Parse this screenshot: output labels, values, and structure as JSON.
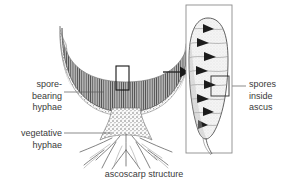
{
  "figure": {
    "caption": "ascoscarp structure",
    "background_color": "#ffffff",
    "text_color": "#3a3a3a"
  },
  "labels": {
    "spore_bearing": "spore-\nbearing\nhyphae",
    "spore_bearing_lines": [
      "spore-",
      "bearing",
      "hyphae"
    ],
    "vegetative": "vegetative\nhyphae",
    "vegetative_lines": [
      "vegetative",
      "hyphae"
    ],
    "spores_inside_ascus": "spores\ninside\nascus",
    "spores_inside_ascus_lines": [
      "spores",
      "inside",
      "ascus"
    ]
  },
  "main_diagram": {
    "name": "ascocarp",
    "parts": {
      "cup": "fruiting body cup with hymenium",
      "stalk": "stalk",
      "roots": "branching vegetative hyphae"
    },
    "callout_box": "magnified region of hymenium"
  },
  "inset": {
    "name": "ascus",
    "contents": "spores inside ascus",
    "spore_count": 8,
    "callout_box": "spore detail"
  },
  "arrow": {
    "name": "magnification-arrow",
    "direction": "right"
  }
}
